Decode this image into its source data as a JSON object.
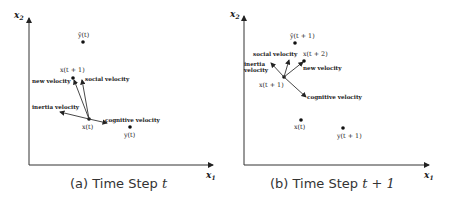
{
  "figure": {
    "panels": [
      {
        "id": "a",
        "caption_prefix": "(a) Time Step ",
        "caption_var": "t",
        "axes": {
          "y_label": "x",
          "y_sub": "2",
          "x_label": "x",
          "x_sub": "1"
        },
        "points": {
          "y_hat": "ŷ(t)",
          "x_next": "x(t + 1)",
          "x_curr": "x(t)",
          "y": "y(t)"
        },
        "vectors": {
          "new": "new velocity",
          "social": "social velocity",
          "inertia": "inertia velocity",
          "cognitive": "cognitive velocity"
        }
      },
      {
        "id": "b",
        "caption_prefix": "(b) Time Step ",
        "caption_var": "t + 1",
        "axes": {
          "y_label": "x",
          "y_sub": "2",
          "x_label": "x",
          "x_sub": "1"
        },
        "points": {
          "y_hat": "ŷ(t + 1)",
          "x_next": "x(t + 2)",
          "x_curr": "x(t + 1)",
          "x_prev": "x(t)",
          "y": "y(t + 1)"
        },
        "vectors": {
          "social": "social velocity",
          "new": "new velocity",
          "inertia_line1": "inertia",
          "inertia_line2": "velocity",
          "cognitive": "cognitive velocity"
        }
      }
    ]
  }
}
